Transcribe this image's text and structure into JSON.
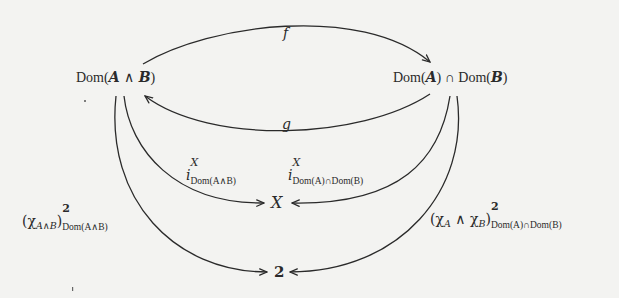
{
  "nodes": {
    "dom_and": {
      "prefix": "Dom(",
      "a": "A",
      "op": " ∧ ",
      "b": "B",
      "suffix": ")"
    },
    "dom_cap": {
      "prefix_a": "Dom(",
      "a": "A",
      "mid": ") ∩ Dom(",
      "b": "B",
      "suffix": ")"
    },
    "x": "X",
    "two": "2"
  },
  "arrows": {
    "f": {
      "label": "f",
      "from": "Dom(A ∧ B)",
      "to": "Dom(A) ∩ Dom(B)"
    },
    "g": {
      "label": "g",
      "from": "Dom(A) ∩ Dom(B)",
      "to": "Dom(A ∧ B)"
    },
    "i_left": {
      "label_main": "i",
      "label_sup": "X",
      "label_sub": "Dom(A∧B)",
      "from": "Dom(A ∧ B)",
      "to": "X"
    },
    "i_right": {
      "label_main": "i",
      "label_sup": "X",
      "label_sub": "Dom(A)∩Dom(B)",
      "from": "Dom(A) ∩ Dom(B)",
      "to": "X"
    },
    "chi_left": {
      "open": "(χ",
      "chi_sub": "A∧B",
      "close": ")",
      "sup": "2",
      "sub": "Dom(A∧B)",
      "from": "Dom(A ∧ B)",
      "to": "2"
    },
    "chi_right": {
      "open": "(χ",
      "chi_a_sub": "A",
      "wedge": " ∧ χ",
      "chi_b_sub": "B",
      "close": ")",
      "sup": "2",
      "sub": "Dom(A)∩Dom(B)",
      "from": "Dom(A) ∩ Dom(B)",
      "to": "2"
    }
  },
  "colors": {
    "background": "#f3f3f1",
    "ink": "#2a2a2a"
  }
}
